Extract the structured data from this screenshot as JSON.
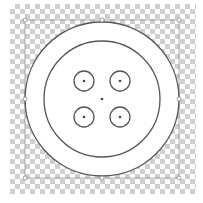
{
  "canvas": {
    "transparent_background": "checkerboard"
  },
  "button_shape": {
    "center": [
      101,
      99
    ],
    "outer_radius": 77,
    "inner_radius": 58,
    "hole_radius": 10,
    "holes": [
      [
        84,
        81
      ],
      [
        120,
        81
      ],
      [
        84,
        117
      ],
      [
        120,
        117
      ]
    ],
    "stroke_color": "#555555",
    "fill_color": "#ffffff"
  },
  "selection": {
    "bbox": [
      25,
      20,
      179,
      178
    ],
    "color": "#888888"
  }
}
